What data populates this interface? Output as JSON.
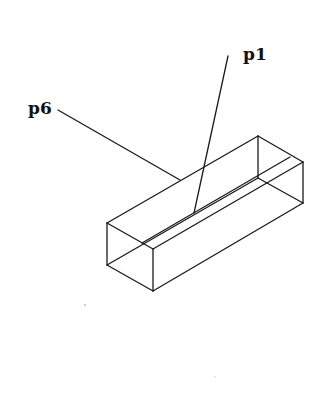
{
  "diagram": {
    "type": "isometric wireframe box with groove",
    "labels": [
      {
        "id": "p1",
        "text": "p1"
      },
      {
        "id": "p6",
        "text": "p6"
      }
    ],
    "stroke_color": "#1a1a1a",
    "background": "#ffffff"
  }
}
